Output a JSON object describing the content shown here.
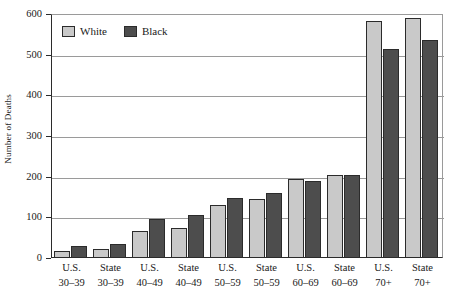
{
  "chart_data": {
    "type": "bar",
    "title": "",
    "xlabel": "",
    "ylabel": "Number of Deaths",
    "ylim": [
      0,
      600
    ],
    "yticks": [
      0,
      100,
      200,
      300,
      400,
      500,
      600
    ],
    "ytick_labels": [
      "0",
      "100",
      "200",
      "300",
      "400",
      "500",
      "600"
    ],
    "grid": true,
    "legend_position": "top-left",
    "categories": [
      {
        "line1": "U.S.",
        "line2": "30–39"
      },
      {
        "line1": "State",
        "line2": "30–39"
      },
      {
        "line1": "U.S.",
        "line2": "40–49"
      },
      {
        "line1": "State",
        "line2": "40–49"
      },
      {
        "line1": "U.S.",
        "line2": "50–59"
      },
      {
        "line1": "State",
        "line2": "50–59"
      },
      {
        "line1": "U.S.",
        "line2": "60–69"
      },
      {
        "line1": "State",
        "line2": "60–69"
      },
      {
        "line1": "U.S.",
        "line2": "70+"
      },
      {
        "line1": "State",
        "line2": "70+"
      }
    ],
    "series": [
      {
        "name": "White",
        "color": "#c9c9c9",
        "values": [
          18,
          22,
          67,
          75,
          130,
          145,
          194,
          205,
          583,
          590
        ]
      },
      {
        "name": "Black",
        "color": "#4d4d4d",
        "values": [
          30,
          35,
          95,
          105,
          147,
          160,
          190,
          205,
          515,
          537
        ]
      }
    ]
  },
  "legend": {
    "items": [
      {
        "label": "White",
        "swatch": "white"
      },
      {
        "label": "Black",
        "swatch": "black"
      }
    ]
  },
  "axis": {
    "y_title": "Number of Deaths"
  },
  "colors": {
    "white_series": "#c9c9c9",
    "black_series": "#4d4d4d",
    "axis": "#2b2b2b",
    "grid": "#9a9a9a",
    "background": "#ffffff"
  }
}
